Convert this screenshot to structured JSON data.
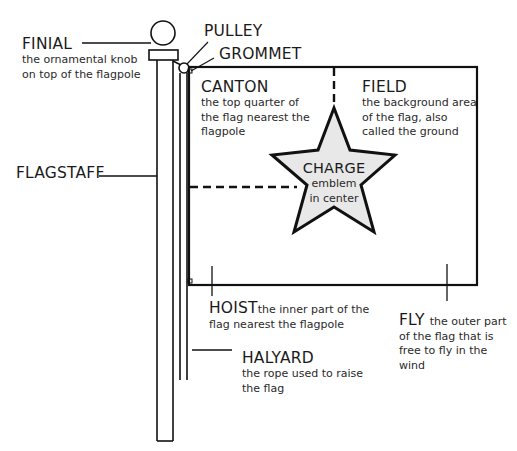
{
  "diagram": {
    "type": "labeled-illustration",
    "colors": {
      "stroke": "#111111",
      "star_fill": "#e8e8e8",
      "background": "#ffffff"
    }
  },
  "labels": {
    "finial": {
      "title": "FINIAL",
      "desc": [
        "the ornamental knob",
        "on top of the flagpole"
      ]
    },
    "pulley": {
      "title": "PULLEY"
    },
    "grommet": {
      "title": "GROMMET"
    },
    "flagstaff": {
      "title": "FLAGSTAFF"
    },
    "canton": {
      "title": "CANTON",
      "desc": [
        "the top quarter of",
        "the flag nearest the",
        "flagpole"
      ]
    },
    "field": {
      "title": "FIELD",
      "desc": [
        "the background area",
        "of the flag, also",
        "called the ground"
      ]
    },
    "charge": {
      "title": "CHARGE",
      "desc": [
        "emblem",
        "in center"
      ]
    },
    "hoist": {
      "title": "HOIST",
      "desc_inline": "the inner part of the",
      "desc": [
        "flag nearest the flagpole"
      ]
    },
    "fly": {
      "title": "FLY",
      "desc_inline": "the outer part",
      "desc": [
        "of the flag that is",
        "free to fly in the",
        "wind"
      ]
    },
    "halyard": {
      "title": "HALYARD",
      "desc": [
        "the rope used to raise",
        "the flag"
      ]
    }
  }
}
